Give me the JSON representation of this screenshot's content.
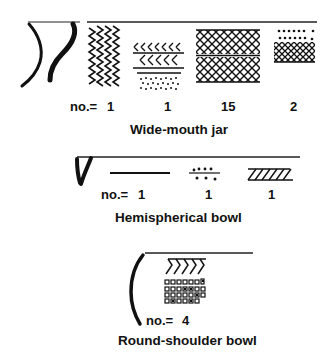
{
  "figure": {
    "groups": [
      {
        "name": "Wide-mouth jar",
        "count_prefix": "no.=",
        "motifs": [
          {
            "pattern": "vertical-zigzag",
            "count": "1"
          },
          {
            "pattern": "chevron-bands-with-punctate",
            "count": "1"
          },
          {
            "pattern": "cross-hatch-two-bands",
            "count": "15"
          },
          {
            "pattern": "dot-rows-over-cross-hatch",
            "count": "2"
          }
        ]
      },
      {
        "name": "Hemispherical bowl",
        "count_prefix": "no.=",
        "motifs": [
          {
            "pattern": "single-incised-line",
            "count": "1"
          },
          {
            "pattern": "line-with-dot-rows",
            "count": "1"
          },
          {
            "pattern": "oblique-hatched-band",
            "count": "1"
          }
        ]
      },
      {
        "name": "Round-shoulder bowl",
        "count_prefix": "no.=",
        "motifs": [
          {
            "pattern": "chevrons-over-stamped-squares",
            "count": "4"
          }
        ]
      }
    ],
    "ink_color": "#111111",
    "background": "#ffffff"
  }
}
